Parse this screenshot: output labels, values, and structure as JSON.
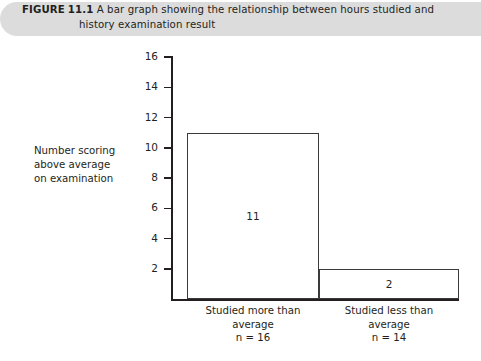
{
  "figure": {
    "label": "FIGURE",
    "number": "11.1",
    "caption_line1": "A bar graph showing the relationship between hours studied and",
    "caption_line2": "history examination result",
    "banner_color": "#dcdcdc"
  },
  "chart_data": {
    "type": "bar",
    "title": "A bar graph showing the relationship between hours studied and history examination result",
    "categories": [
      "Studied more than average",
      "Studied less than average"
    ],
    "category_lines": [
      [
        "Studied more than",
        "average",
        "n = 16"
      ],
      [
        "Studied less than",
        "average",
        "n = 14"
      ]
    ],
    "values": [
      11,
      2
    ],
    "data_labels": [
      "11",
      "2"
    ],
    "group_sizes": [
      16,
      14
    ],
    "xlabel": "",
    "ylabel": "Number scoring above average on examination",
    "ylabel_lines": [
      "Number scoring",
      "above average",
      "on examination"
    ],
    "ylim": [
      0,
      16
    ],
    "yticks": [
      2,
      4,
      6,
      8,
      10,
      12,
      14,
      16
    ],
    "ytick_labels": [
      "2",
      "4",
      "6",
      "8",
      "10",
      "12",
      "14",
      "16"
    ],
    "grid": false,
    "legend": false,
    "bar_fill": "#ffffff",
    "bar_edge_color": "#3a3a3a",
    "axis_color": "#231f20"
  }
}
